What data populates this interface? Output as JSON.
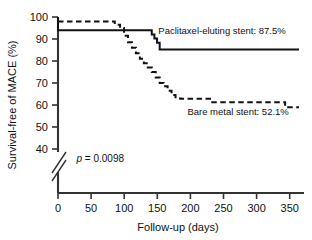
{
  "chart_data": {
    "type": "line",
    "title": "",
    "subtitle": "",
    "xlabel": "Follow-up (days)",
    "ylabel": "Survival-free of MACE (%)",
    "xlim": [
      0,
      365
    ],
    "ylim": [
      37,
      100
    ],
    "y_axis_break": true,
    "y_axis_break_below": 40,
    "grid": false,
    "legend_position": "inline-annotations",
    "xticks": [
      0,
      50,
      100,
      150,
      200,
      250,
      300,
      350
    ],
    "xtick_labels": [
      "0",
      "50",
      "100",
      "150",
      "200",
      "250",
      "300",
      "350"
    ],
    "yticks": [
      40,
      50,
      60,
      70,
      80,
      90,
      100
    ],
    "ytick_labels": [
      "40",
      "50",
      "60",
      "70",
      "80",
      "90",
      "100"
    ],
    "annotations": [
      {
        "name": "p-value",
        "text_italic": "p",
        "text_rest": " = 0.0098",
        "full_text": "p = 0.0098",
        "x": 28,
        "y": 44
      }
    ],
    "series": [
      {
        "name": "Paclitaxel-eluting stent",
        "label": "Paclitaxel-eluting stent: 87.5%",
        "final_value": 87.5,
        "linestyle": "solid",
        "color": "#111111",
        "linewidth": 2.0,
        "step": "post",
        "x": [
          0,
          0,
          138,
          142,
          146,
          150,
          154,
          365
        ],
        "y": [
          100,
          94.0,
          94.0,
          92.0,
          90.2,
          88.3,
          85.2,
          85.2
        ],
        "label_x": 152,
        "label_y": 92.5
      },
      {
        "name": "Bare metal stent",
        "label": "Bare metal stent: 52.1%",
        "final_value": 52.1,
        "linestyle": "dashed",
        "color": "#111111",
        "linewidth": 2.0,
        "step": "post",
        "x": [
          0,
          78,
          86,
          94,
          100,
          106,
          112,
          118,
          124,
          130,
          136,
          142,
          148,
          154,
          160,
          166,
          172,
          178,
          186,
          226,
          232,
          336,
          344,
          365
        ],
        "y": [
          98.0,
          98.0,
          96.5,
          95.0,
          91.5,
          88.5,
          86.0,
          83.5,
          81.0,
          79.0,
          77.0,
          75.0,
          72.5,
          70.0,
          68.5,
          66.5,
          64.5,
          63.0,
          62.8,
          62.8,
          61.3,
          61.3,
          59.0,
          59.0
        ],
        "label_x": 196,
        "label_y": 55.5
      }
    ]
  },
  "axes": {
    "x_title": "Follow-up (days)",
    "y_title": "Survival-free of MACE (%)"
  }
}
